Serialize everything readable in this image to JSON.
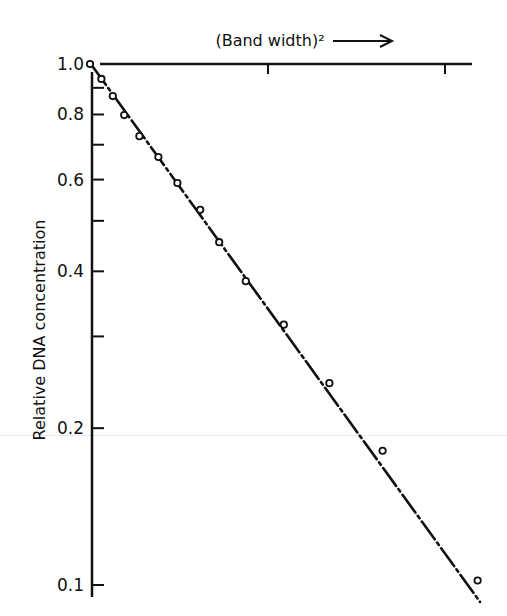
{
  "chart_data": {
    "type": "scatter",
    "title": "",
    "xlabel": "(Band width)²",
    "xlabel_arrow": "→",
    "ylabel": "Relative DNA concentration",
    "yscale": "log",
    "ylim": [
      0.1,
      1.0
    ],
    "y_tick_labels": [
      "1.0",
      "0.8",
      "0.6",
      "0.4",
      "0.2",
      "0.1"
    ],
    "y_ticks": [
      1.0,
      0.9,
      0.8,
      0.7,
      0.6,
      0.5,
      0.4,
      0.3,
      0.2,
      0.1
    ],
    "x_axis_position": "top",
    "x_ticks_relative": [
      0.46,
      0.95
    ],
    "x_units": "relative (no numeric labels shown)",
    "grid": false,
    "legend": null,
    "fit_line": {
      "style": "dash-dot",
      "from": [
        0.0,
        1.0
      ],
      "to": [
        1.0,
        0.097
      ]
    },
    "series": [
      {
        "name": "DNA band profile",
        "marker": "open-circle",
        "x": [
          0.0,
          0.03,
          0.06,
          0.09,
          0.13,
          0.18,
          0.23,
          0.29,
          0.34,
          0.41,
          0.51,
          0.63,
          0.77,
          1.02
        ],
        "y": [
          1.0,
          0.936,
          0.868,
          0.798,
          0.727,
          0.663,
          0.591,
          0.525,
          0.455,
          0.383,
          0.316,
          0.244,
          0.181,
          0.102
        ]
      }
    ]
  }
}
